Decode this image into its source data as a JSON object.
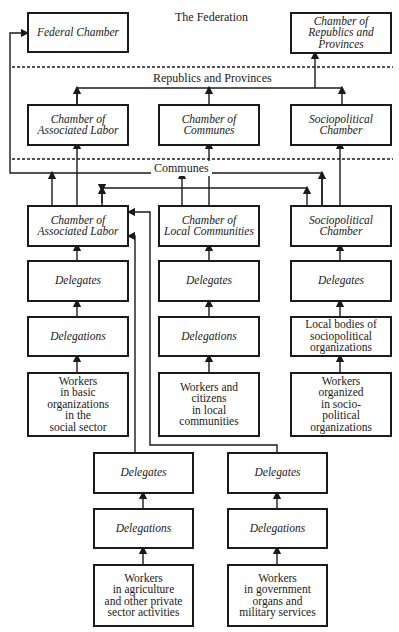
{
  "diagram": {
    "levels": {
      "federation": "The Federation",
      "republics": "Republics and Provinces",
      "communes": "Communes"
    },
    "federation": {
      "federal_chamber": "Federal Chamber",
      "chamber_republics": "Chamber of\nRepublics and\nProvinces"
    },
    "republic": {
      "associated_labor": "Chamber of\nAssociated Labor",
      "communes": "Chamber of\nCommunes",
      "sociopolitical": "Sociopolitical\nChamber"
    },
    "commune": {
      "associated_labor": "Chamber of\nAssociated Labor",
      "local_communities": "Chamber of\nLocal Communities",
      "sociopolitical": "Sociopolitical\nChamber"
    },
    "columns": {
      "left": {
        "delegates": "Delegates",
        "delegations": "Delegations",
        "workers": "Workers\nin basic\norganizations\nin the\nsocial sector"
      },
      "middle": {
        "delegates": "Delegates",
        "delegations": "Delegations",
        "workers": "Workers and\ncitizens\nin local\ncommunities"
      },
      "right": {
        "delegates": "Delegates",
        "delegations": "Local bodies of\nsociopolitical\norganizations",
        "workers": "Workers\norganized\nin socio-\npolitical\norganizations"
      },
      "bottom_left": {
        "delegates": "Delegates",
        "delegations": "Delegations",
        "workers": "Workers\nin agriculture\nand other private\nsector activities"
      },
      "bottom_right": {
        "delegates": "Delegates",
        "delegations": "Delegations",
        "workers": "Workers\nin government\norgans and\nmilitary services"
      }
    }
  }
}
